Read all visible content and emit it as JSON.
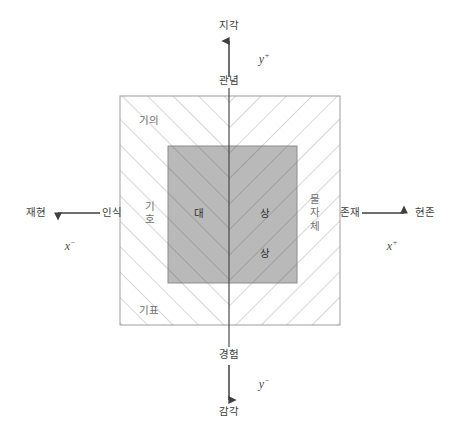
{
  "figure": {
    "type": "semiotic-quadrant-diagram",
    "background_color": "#ffffff",
    "outer_box": {
      "name": "hatched-field",
      "x": 120,
      "y": 96,
      "width": 220,
      "height": 229,
      "border_color": "#9a9a9a",
      "fill": "none",
      "hatch_color": "#b0b0b0",
      "hatch_pattern": "chevron-converging-on-vertical-axis"
    },
    "inner_box": {
      "name": "object-image-box",
      "x": 168,
      "y": 146,
      "width": 129,
      "height": 137,
      "fill_color": "#b9b9b9",
      "border_color": "#8a8a8a"
    },
    "axes": {
      "vertical_x": 229,
      "horizontal_y": 213,
      "line_color": "#4a4a4a"
    }
  },
  "axis_labels": {
    "y_positive": {
      "symbol": "y",
      "sign": "+"
    },
    "y_negative": {
      "symbol": "y",
      "sign": "−"
    },
    "x_positive": {
      "symbol": "x",
      "sign": "+"
    },
    "x_negative": {
      "symbol": "x",
      "sign": "−"
    }
  },
  "axis_endpoints": {
    "top_outer": "지각",
    "top_inner": "관념",
    "bottom_inner": "경험",
    "bottom_outer": "감각",
    "left_outer": "재현",
    "left_inner": "인식",
    "right_inner": "존재",
    "right_outer": "현존"
  },
  "field_labels": {
    "top_left": "기의",
    "bottom_left": "기표",
    "left_vertical": [
      "기",
      "호"
    ],
    "right_vertical": [
      "물",
      "자",
      "체"
    ]
  },
  "inner_labels": {
    "left": "대",
    "right_top": "상",
    "right_bottom": "상"
  }
}
